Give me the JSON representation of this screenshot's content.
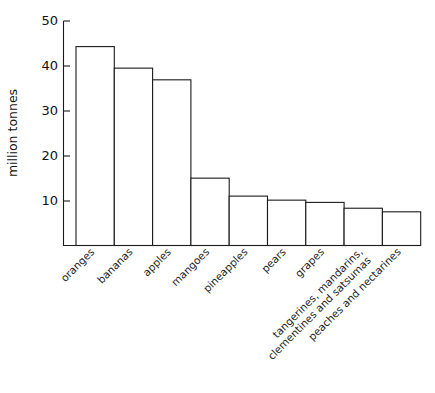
{
  "chart_data": {
    "type": "bar",
    "title": "",
    "subtitle": "",
    "xlabel": "",
    "ylabel": "million tonnes",
    "ylim": [
      0,
      50
    ],
    "yticks": [
      10,
      20,
      30,
      40,
      50
    ],
    "ytick_labels": [
      "10",
      "20",
      "30",
      "40",
      "50"
    ],
    "grid": false,
    "legend": false,
    "legend_position": "none",
    "categories": [
      "oranges",
      "bananas",
      "apples",
      "mangoes",
      "pineapples",
      "pears",
      "grapes",
      "tangerines, mandarins,\nclementines and satsumas",
      "peaches and nectarines"
    ],
    "values": [
      44.3,
      39.5,
      36.9,
      15.0,
      11.0,
      10.1,
      9.6,
      8.3,
      7.5
    ],
    "bar_fill": "#ffffff",
    "bar_stroke": "#1a1a1a",
    "axis_color": "#1a1a1a",
    "background": "#ffffff",
    "label_rotation_deg": -45
  },
  "axis": {
    "y_label_text": "million tonnes",
    "tick_0": "10",
    "tick_1": "20",
    "tick_2": "30",
    "tick_3": "40",
    "tick_4": "50"
  },
  "categories_display": {
    "c0": "oranges",
    "c1": "bananas",
    "c2": "apples",
    "c3": "mangoes",
    "c4": "pineapples",
    "c5": "pears",
    "c6": "grapes",
    "c7a": "tangerines, mandarins,",
    "c7b": "clementines and satsumas",
    "c8": "peaches and nectarines"
  }
}
